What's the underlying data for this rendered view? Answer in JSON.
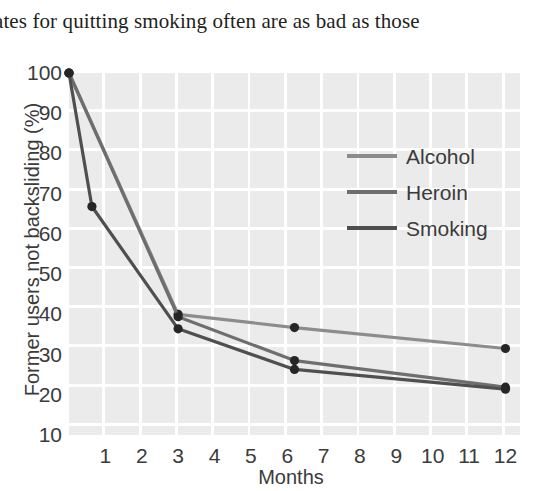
{
  "caption": {
    "text": "ates for quitting smoking often are as bad as those"
  },
  "chart_data": {
    "type": "line",
    "title": "",
    "xlabel": "Months",
    "ylabel": "Former users not backsliding (%)",
    "xlim": [
      0,
      12.4
    ],
    "ylim": [
      10,
      100
    ],
    "xticks": [
      "1",
      "2",
      "3",
      "4",
      "5",
      "6",
      "7",
      "8",
      "9",
      "10",
      "11",
      "12"
    ],
    "xtick_values": [
      1,
      2,
      3,
      4,
      5,
      6,
      7,
      8,
      9,
      10,
      11,
      12
    ],
    "yticks": [
      "10",
      "20",
      "30",
      "40",
      "50",
      "60",
      "70",
      "80",
      "90",
      "100"
    ],
    "ytick_values": [
      10,
      20,
      30,
      40,
      50,
      60,
      70,
      80,
      90,
      100
    ],
    "grid": true,
    "grid_color": "#ffffff",
    "panel_color": "#ebebeb",
    "legend_position": "upper right",
    "markers": "filled-circle",
    "series": [
      {
        "name": "Alcohol",
        "color": "#8c8c8c",
        "points": [
          {
            "x": 0,
            "y": 100
          },
          {
            "x": 3,
            "y": 40.0
          },
          {
            "x": 6.2,
            "y": 36.7
          },
          {
            "x": 12,
            "y": 31.5
          }
        ]
      },
      {
        "name": "Heroin",
        "color": "#6e6e6e",
        "points": [
          {
            "x": 0,
            "y": 100
          },
          {
            "x": 3,
            "y": 39.4
          },
          {
            "x": 6.2,
            "y": 28.5
          },
          {
            "x": 12,
            "y": 21.9
          }
        ]
      },
      {
        "name": "Smoking",
        "color": "#4f4f4f",
        "points": [
          {
            "x": 0,
            "y": 100
          },
          {
            "x": 0.63,
            "y": 66.8
          },
          {
            "x": 3,
            "y": 36.4
          },
          {
            "x": 6.2,
            "y": 26.3
          },
          {
            "x": 12,
            "y": 21.4
          }
        ]
      }
    ]
  }
}
